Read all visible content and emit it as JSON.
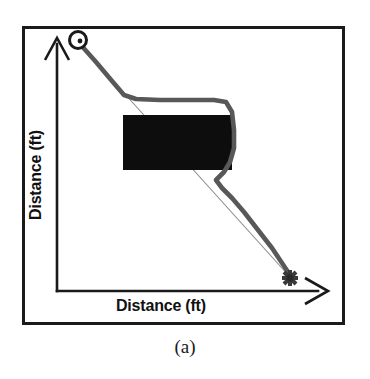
{
  "figure": {
    "caption": "(a)",
    "axes": {
      "x_label": "Distance (ft)",
      "y_label": "Distance (ft)"
    },
    "colors": {
      "frame": "#1a1a1a",
      "axis": "#1a1a1a",
      "obstacle": "#0d0d0d",
      "planned_path": "#585858",
      "direct_line": "#8a8a8a",
      "background": "#ffffff"
    },
    "markers": {
      "start": {
        "name": "start-point",
        "shape": "circle",
        "x": 78,
        "y": 40
      },
      "goal": {
        "name": "goal-point",
        "shape": "star",
        "x": 290,
        "y": 278
      }
    },
    "obstacle": {
      "name": "obstacle-rectangle",
      "x": 123,
      "y": 115,
      "width": 109,
      "height": 55
    },
    "axis_geometry": {
      "origin_x": 57,
      "origin_y": 291,
      "y_axis_top": 38,
      "x_axis_right": 325
    },
    "direct_line": {
      "name": "straight-line-start-to-goal",
      "points": "78,42 290,277"
    },
    "planned_path": {
      "name": "planned-path-around-obstacle",
      "points": "80,44 96,62 112,81 124,95 136,99 160,100 188,100 214,100 226,102 232,112 234,130 234,148 230,162 224,172 216,180 222,188 232,198 244,212 258,230 272,248 284,266 290,275"
    }
  }
}
